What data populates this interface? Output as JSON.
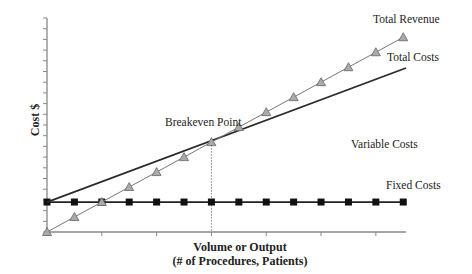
{
  "chart_data": {
    "type": "line",
    "title": "",
    "xlabel": "Volume or Output",
    "xlabel_sub": "(# of Procedures, Patients)",
    "ylabel": "Cost $",
    "x": [
      0,
      1,
      2,
      3,
      4,
      5,
      6,
      7,
      8,
      9,
      10,
      11,
      12,
      13
    ],
    "xlim": [
      0,
      13.1
    ],
    "ylim": [
      0,
      20
    ],
    "grid": false,
    "legend_position": "inline labels at right end of lines",
    "x_ticks": [
      0,
      2,
      4,
      6,
      8,
      10,
      12
    ],
    "y_tick_count": 21,
    "series": [
      {
        "name": "Total Revenue",
        "marker": "triangle",
        "color": "#999999",
        "values": [
          0,
          1.4,
          2.8,
          4.2,
          5.6,
          7.0,
          8.4,
          9.8,
          11.2,
          12.6,
          14.0,
          15.4,
          16.8,
          18.2
        ]
      },
      {
        "name": "Total Costs",
        "marker": "none",
        "color": "#333333",
        "values": [
          2.8,
          3.77,
          4.74,
          5.71,
          6.68,
          7.65,
          8.62,
          9.59,
          10.56,
          11.53,
          12.5,
          13.47,
          14.44,
          15.41
        ]
      },
      {
        "name": "Fixed Costs",
        "marker": "square",
        "color": "#111111",
        "values": [
          2.8,
          2.8,
          2.8,
          2.8,
          2.8,
          2.8,
          2.8,
          2.8,
          2.8,
          2.8,
          2.8,
          2.8,
          2.8,
          2.8
        ]
      }
    ],
    "annotations": [
      {
        "text": "Breakeven Point",
        "x": 6,
        "y": 8.4,
        "note": "dotted vertical drop line to x-axis"
      },
      {
        "text": "Variable Costs",
        "region": "between Total Costs and Fixed Costs"
      }
    ]
  },
  "labels": {
    "total_revenue": "Total Revenue",
    "total_costs": "Total Costs",
    "fixed_costs": "Fixed Costs",
    "variable_costs": "Variable Costs",
    "breakeven": "Breakeven Point",
    "ylabel": "Cost $",
    "xlabel_line1": "Volume or Output",
    "xlabel_line2": "(# of Procedures, Patients)"
  },
  "colors": {
    "axis": "#888888",
    "revenue_line": "#777777",
    "revenue_marker_fill": "#aaaaaa",
    "cost_line": "#2b2b2b",
    "fixed_line": "#222222",
    "fixed_marker": "#111111"
  }
}
